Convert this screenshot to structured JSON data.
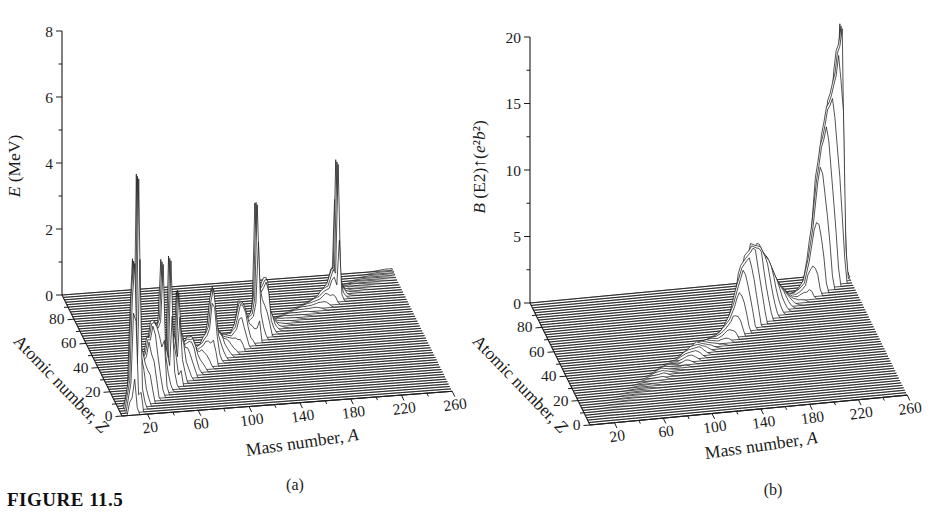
{
  "figure": {
    "caption": "FIGURE 11.5",
    "panel_a_tag": "(a)",
    "panel_b_tag": "(b)"
  },
  "colors": {
    "ink": "#1b1b1b",
    "paper": "#ffffff"
  },
  "chart_data": [
    {
      "id": "panel-a",
      "type": "3d-waterfall",
      "tag": "(a)",
      "x_axis": {
        "label_parts": [
          {
            "t": "Mass number, ",
            "i": 0
          },
          {
            "t": "A",
            "i": 1
          }
        ],
        "range": [
          0,
          260
        ],
        "ticks_labeled": [
          20,
          60,
          100,
          140,
          180,
          220,
          260
        ],
        "ticks_minor": [
          40,
          80,
          120,
          160,
          200,
          240
        ]
      },
      "z_axis": {
        "label_parts": [
          {
            "t": "Atomic number, ",
            "i": 0
          },
          {
            "t": "Z",
            "i": 1
          }
        ],
        "range": [
          0,
          100
        ],
        "ticks_labeled": [
          0,
          20,
          40,
          60,
          80
        ],
        "ticks_minor": [
          10,
          30,
          50,
          70,
          90
        ]
      },
      "y_axis": {
        "label_parts": [
          {
            "t": "E",
            "i": 1
          },
          {
            "t": " (MeV)",
            "i": 0
          }
        ],
        "range": [
          0,
          8
        ],
        "ticks_labeled": [
          0,
          2,
          4,
          6,
          8
        ],
        "ticks_minor": [
          1,
          3,
          5,
          7
        ]
      },
      "band": {
        "full_halfwidth_z": 2.5,
        "zero_halfwidth_z": 6
      },
      "ridge": [
        [
          4,
          0
        ],
        [
          8,
          0.9
        ],
        [
          10,
          3.37
        ],
        [
          12,
          4.44
        ],
        [
          14,
          1.5
        ],
        [
          16,
          6.92
        ],
        [
          18,
          1.6
        ],
        [
          20,
          1.63
        ],
        [
          22,
          1.25
        ],
        [
          24,
          1.37
        ],
        [
          26,
          1.8
        ],
        [
          28,
          1.78
        ],
        [
          30,
          2.2
        ],
        [
          32,
          2.23
        ],
        [
          34,
          2.1
        ],
        [
          36,
          1.97
        ],
        [
          38,
          2.17
        ],
        [
          40,
          3.9
        ],
        [
          42,
          1.52
        ],
        [
          44,
          1.16
        ],
        [
          46,
          0.89
        ],
        [
          48,
          3.83
        ],
        [
          50,
          1.55
        ],
        [
          52,
          1.43
        ],
        [
          54,
          0.84
        ],
        [
          56,
          2.7
        ],
        [
          58,
          1.45
        ],
        [
          60,
          1.33
        ],
        [
          62,
          0.95
        ],
        [
          64,
          0.99
        ],
        [
          66,
          1.04
        ],
        [
          68,
          1.02
        ],
        [
          70,
          1.04
        ],
        [
          72,
          0.83
        ],
        [
          74,
          0.6
        ],
        [
          76,
          0.56
        ],
        [
          78,
          0.61
        ],
        [
          80,
          0.66
        ],
        [
          82,
          0.78
        ],
        [
          84,
          0.88
        ],
        [
          86,
          1.08
        ],
        [
          88,
          1.84
        ],
        [
          90,
          2.19
        ],
        [
          92,
          1.51
        ],
        [
          94,
          0.87
        ],
        [
          96,
          0.77
        ],
        [
          98,
          0.65
        ],
        [
          100,
          0.53
        ],
        [
          104,
          0.47
        ],
        [
          108,
          0.43
        ],
        [
          112,
          0.62
        ],
        [
          116,
          1.29
        ],
        [
          120,
          1.17
        ],
        [
          124,
          0.6
        ],
        [
          128,
          0.74
        ],
        [
          130,
          1.2
        ],
        [
          132,
          4.04
        ],
        [
          134,
          1.58
        ],
        [
          136,
          1.31
        ],
        [
          138,
          1.44
        ],
        [
          140,
          1.6
        ],
        [
          142,
          1.58
        ],
        [
          144,
          0.7
        ],
        [
          148,
          0.3
        ],
        [
          152,
          0.12
        ],
        [
          156,
          0.09
        ],
        [
          160,
          0.087
        ],
        [
          164,
          0.08
        ],
        [
          168,
          0.08
        ],
        [
          172,
          0.079
        ],
        [
          176,
          0.088
        ],
        [
          180,
          0.093
        ],
        [
          184,
          0.11
        ],
        [
          188,
          0.155
        ],
        [
          192,
          0.21
        ],
        [
          196,
          0.36
        ],
        [
          200,
          0.43
        ],
        [
          204,
          0.9
        ],
        [
          206,
          0.8
        ],
        [
          208,
          4.09
        ],
        [
          210,
          0.85
        ],
        [
          212,
          0.33
        ],
        [
          216,
          0.1
        ],
        [
          220,
          0.05
        ],
        [
          224,
          0.06
        ],
        [
          228,
          0.06
        ],
        [
          232,
          0.049
        ],
        [
          236,
          0.045
        ],
        [
          240,
          0.043
        ],
        [
          244,
          0.045
        ],
        [
          248,
          0.043
        ],
        [
          252,
          0.046
        ],
        [
          256,
          0.05
        ],
        [
          260,
          0.05
        ]
      ]
    },
    {
      "id": "panel-b",
      "type": "3d-waterfall",
      "tag": "(b)",
      "x_axis": {
        "label_parts": [
          {
            "t": "Mass number, ",
            "i": 0
          },
          {
            "t": "A",
            "i": 1
          }
        ],
        "range": [
          0,
          260
        ],
        "ticks_labeled": [
          20,
          60,
          100,
          140,
          180,
          220,
          260
        ],
        "ticks_minor": [
          40,
          80,
          120,
          160,
          200,
          240
        ]
      },
      "z_axis": {
        "label_parts": [
          {
            "t": "Atomic number, ",
            "i": 0
          },
          {
            "t": "Z",
            "i": 1
          }
        ],
        "range": [
          0,
          100
        ],
        "ticks_labeled": [
          0,
          20,
          40,
          60,
          80
        ],
        "ticks_minor": [
          10,
          30,
          50,
          70,
          90
        ]
      },
      "y_axis": {
        "label_parts": [
          {
            "t": "B",
            "i": 1
          },
          {
            "t": " (E2)",
            "i": 0
          },
          {
            "t": "↑",
            "i": 0
          },
          {
            "t": "(",
            "i": 0
          },
          {
            "t": "e",
            "i": 1
          },
          {
            "t": "²",
            "i": 0
          },
          {
            "t": "b",
            "i": 1
          },
          {
            "t": "²",
            "i": 0
          },
          {
            "t": ")",
            "i": 0
          }
        ],
        "range": [
          0,
          20
        ],
        "ticks_labeled": [
          0,
          5,
          10,
          15,
          20
        ],
        "ticks_minor": [
          2.5,
          7.5,
          12.5,
          17.5
        ]
      },
      "band": {
        "full_halfwidth_z": 2.5,
        "zero_halfwidth_z": 6
      },
      "ridge": [
        [
          6,
          0
        ],
        [
          10,
          0.01
        ],
        [
          20,
          0.03
        ],
        [
          30,
          0.04
        ],
        [
          40,
          0.06
        ],
        [
          50,
          0.08
        ],
        [
          56,
          0.1
        ],
        [
          60,
          0.13
        ],
        [
          64,
          0.17
        ],
        [
          68,
          0.19
        ],
        [
          72,
          0.24
        ],
        [
          76,
          0.32
        ],
        [
          80,
          0.25
        ],
        [
          84,
          0.18
        ],
        [
          88,
          0.13
        ],
        [
          92,
          0.1
        ],
        [
          96,
          0.26
        ],
        [
          100,
          0.45
        ],
        [
          104,
          0.55
        ],
        [
          108,
          0.62
        ],
        [
          112,
          0.7
        ],
        [
          116,
          0.55
        ],
        [
          120,
          0.45
        ],
        [
          124,
          0.35
        ],
        [
          128,
          0.28
        ],
        [
          132,
          0.22
        ],
        [
          136,
          0.4
        ],
        [
          140,
          0.75
        ],
        [
          144,
          1.2
        ],
        [
          148,
          2.1
        ],
        [
          152,
          3.4
        ],
        [
          156,
          4.6
        ],
        [
          160,
          5.1
        ],
        [
          164,
          5.5
        ],
        [
          166,
          5.8
        ],
        [
          170,
          5.6
        ],
        [
          174,
          5.5
        ],
        [
          178,
          4.7
        ],
        [
          182,
          4.2
        ],
        [
          186,
          3.3
        ],
        [
          190,
          2.4
        ],
        [
          194,
          1.7
        ],
        [
          198,
          1.2
        ],
        [
          202,
          0.7
        ],
        [
          206,
          0.4
        ],
        [
          210,
          0.3
        ],
        [
          214,
          0.5
        ],
        [
          218,
          0.9
        ],
        [
          222,
          2.5
        ],
        [
          226,
          4.8
        ],
        [
          230,
          8.2
        ],
        [
          232,
          9.3
        ],
        [
          234,
          10.6
        ],
        [
          236,
          11.2
        ],
        [
          238,
          12.1
        ],
        [
          240,
          13.2
        ],
        [
          242,
          13.5
        ],
        [
          244,
          14.0
        ],
        [
          246,
          14.8
        ],
        [
          248,
          15.5
        ],
        [
          250,
          17.0
        ],
        [
          252,
          17.5
        ],
        [
          254,
          18.8
        ],
        [
          256,
          5.0
        ],
        [
          258,
          0.5
        ],
        [
          260,
          0.2
        ]
      ]
    }
  ]
}
